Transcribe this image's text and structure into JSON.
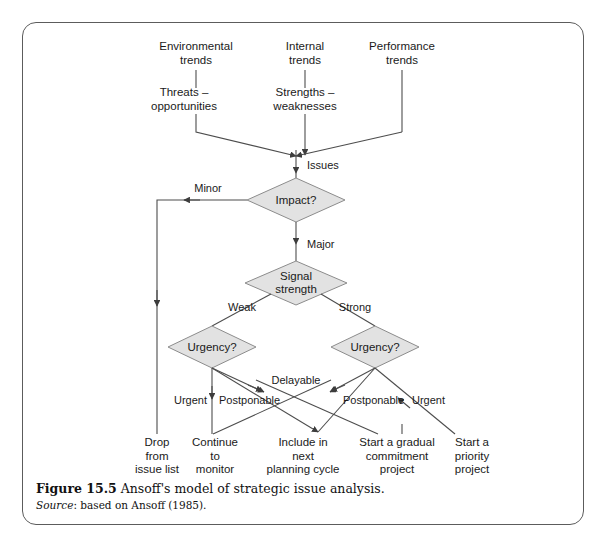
{
  "figure": {
    "caption_number": "Figure 15.5",
    "caption_title": "Ansoff's model of strategic issue analysis.",
    "source_label": "Source",
    "source_text": ": based on Ansoff (1985)."
  },
  "colors": {
    "diamond_fill": "#e2e2e2",
    "diamond_stroke": "#8c8c8c",
    "line": "#4d4d4d",
    "frame": "#5c5c5c",
    "text": "#1a1a1a"
  },
  "inputs": [
    {
      "id": "environmental-trends",
      "label": "Environmental\ntrends"
    },
    {
      "id": "internal-trends",
      "label": "Internal\ntrends"
    },
    {
      "id": "performance-trends",
      "label": "Performance\ntrends"
    }
  ],
  "analyses": [
    {
      "id": "threats-opportunities",
      "label": "Threats –\nopportunities"
    },
    {
      "id": "strengths-weaknesses",
      "label": "Strengths –\nweaknesses"
    }
  ],
  "issues_label": "Issues",
  "decisions": [
    {
      "id": "impact",
      "label": "Impact?"
    },
    {
      "id": "signal-strength",
      "label": "Signal\nstrength"
    },
    {
      "id": "urgency-left",
      "label": "Urgency?"
    },
    {
      "id": "urgency-right",
      "label": "Urgency?"
    }
  ],
  "edge_labels": {
    "minor": "Minor",
    "major": "Major",
    "weak": "Weak",
    "strong": "Strong",
    "delayable": "Delayable",
    "urgent_left": "Urgent",
    "postponable_left": "Postponable",
    "postponable_right": "Postponable",
    "urgent_right": "Urgent"
  },
  "outcomes": [
    {
      "id": "drop-from-issue-list",
      "label": "Drop\nfrom\nissue list"
    },
    {
      "id": "continue-to-monitor",
      "label": "Continue\nto\nmonitor"
    },
    {
      "id": "include-in-next-planning-cycle",
      "label": "Include in\nnext\nplanning cycle"
    },
    {
      "id": "start-a-gradual-commitment-project",
      "label": "Start a gradual\ncommitment\nproject"
    },
    {
      "id": "start-a-priority-project",
      "label": "Start a\npriority\nproject"
    }
  ]
}
